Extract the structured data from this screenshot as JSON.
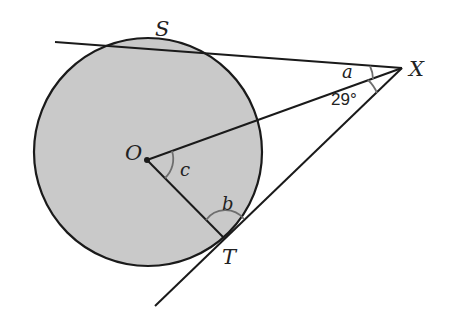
{
  "diagram": {
    "type": "geometry-circle-tangents",
    "colors": {
      "circle_fill": "#c9c9c9",
      "stroke": "#1a1a1a",
      "arc": "#6e6e6e",
      "background": "#ffffff"
    },
    "circle": {
      "center_label": "O",
      "cx": 148,
      "cy": 152,
      "r": 114
    },
    "points": {
      "S": {
        "label": "S"
      },
      "X": {
        "label": "X"
      },
      "T": {
        "label": "T"
      },
      "O": {
        "label": "O"
      }
    },
    "angles": {
      "a": {
        "label": "a"
      },
      "b": {
        "label": "b"
      },
      "c": {
        "label": "c"
      },
      "given": {
        "label": "29°",
        "value": 29
      }
    }
  }
}
